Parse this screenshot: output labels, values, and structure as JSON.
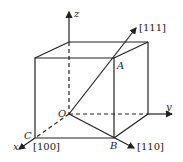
{
  "diagram": {
    "type": "cubic crystal direction diagram",
    "axes": {
      "x": "x",
      "y": "y",
      "z": "z"
    },
    "points": {
      "origin": "O",
      "A": "A",
      "B": "B",
      "C": "C"
    },
    "directions": {
      "d111": "[111]",
      "d110": "[110]",
      "d100": "[100]"
    },
    "colors": {
      "line": "#222222",
      "background": "#ffffff"
    }
  }
}
